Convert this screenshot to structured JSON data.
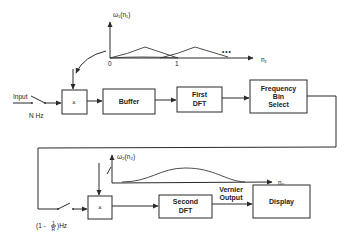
{
  "diagram": {
    "title": "",
    "stage1": {
      "input_label": "Input",
      "input_rate": "N Hz",
      "multiplier_symbol": "×",
      "window_label": "ω₁(n₁)",
      "window_axis_label": "n₁",
      "window_tick_0": "0",
      "window_tick_1": "1",
      "window_ellipsis": "•••",
      "blocks": [
        "Buffer",
        "First DFT",
        "Frequency Bin Select"
      ]
    },
    "stage2": {
      "input_rate": "(1 - 1/R) Hz",
      "rate_prefix": "(1 -",
      "rate_num": "1",
      "rate_den": "R",
      "rate_suffix": ")Hz",
      "multiplier_symbol": "×",
      "window_label": "ω₂(n₂)",
      "window_axis_label": "n₂",
      "blocks": [
        "Second DFT",
        "Display"
      ],
      "output_label_line1": "Vernier",
      "output_label_line2": "Output"
    },
    "block_labels": {
      "buffer": "Buffer",
      "first_dft_1": "First",
      "first_dft_2": "DFT",
      "fbs_1": "Frequency",
      "fbs_2": "Bin",
      "fbs_3": "Select",
      "second_dft_1": "Second",
      "second_dft_2": "DFT",
      "display": "Display"
    },
    "colors": {
      "line": "#2a2a2a",
      "background": "#ffffff"
    }
  }
}
